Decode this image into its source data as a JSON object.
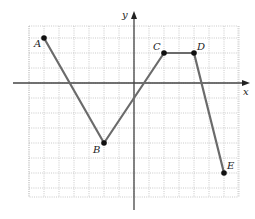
{
  "chart_data": {
    "type": "line",
    "title": "",
    "xlabel": "x",
    "ylabel": "y",
    "grid": true,
    "xlim": [
      -7,
      7
    ],
    "ylim": [
      -7,
      4
    ],
    "points": [
      {
        "label": "A",
        "x": -6,
        "y": 3
      },
      {
        "label": "B",
        "x": -2,
        "y": -4
      },
      {
        "label": "C",
        "x": 2,
        "y": 2
      },
      {
        "label": "D",
        "x": 4,
        "y": 2
      },
      {
        "label": "E",
        "x": 6,
        "y": -6
      }
    ],
    "series": [
      {
        "name": "polyline ABCDE",
        "x": [
          -6,
          -2,
          2,
          4,
          6
        ],
        "y": [
          3,
          -4,
          2,
          2,
          -6
        ]
      }
    ]
  },
  "axes": {
    "x_label": "x",
    "y_label": "y"
  },
  "colors": {
    "line": "#6b6b6b",
    "point": "#111111",
    "axis": "#444444",
    "grid": "#bdbdbd"
  }
}
